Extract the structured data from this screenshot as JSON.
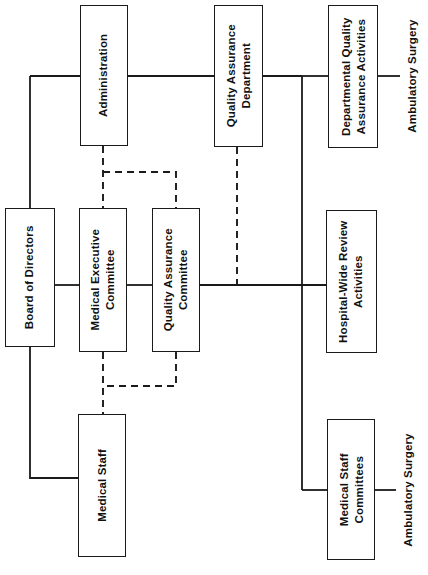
{
  "diagram": {
    "type": "organizational-chart",
    "orientation": "rotated-90-ccw",
    "background_color": "#ffffff",
    "line_color": "#1a1a1a",
    "text_color": "#111111",
    "nodes": [
      {
        "id": "administration",
        "label": "Administration",
        "x": 80,
        "y": 5,
        "w": 48,
        "h": 141
      },
      {
        "id": "quality-assurance-department",
        "label": "Quality Assurance\nDepartment",
        "x": 214,
        "y": 5,
        "w": 49,
        "h": 142
      },
      {
        "id": "departmental-quality-assurance-activities",
        "label": "Departmental Quality\nAssurance Activities",
        "x": 328,
        "y": 5,
        "w": 50,
        "h": 143
      },
      {
        "id": "board-of-directors",
        "label": "Board of Directors",
        "x": 5,
        "y": 208,
        "w": 50,
        "h": 139
      },
      {
        "id": "medical-executive-committee",
        "label": "Medical Executive\nCommittee",
        "x": 79,
        "y": 208,
        "w": 48,
        "h": 144
      },
      {
        "id": "quality-assurance-committee",
        "label": "Quality Assurance\nCommittee",
        "x": 152,
        "y": 208,
        "w": 48,
        "h": 144
      },
      {
        "id": "hospital-wide-review-activities",
        "label": "Hospital-Wide Review\nActivities",
        "x": 326,
        "y": 210,
        "w": 51,
        "h": 143
      },
      {
        "id": "medical-staff",
        "label": "Medical Staff",
        "x": 78,
        "y": 414,
        "w": 48,
        "h": 143
      },
      {
        "id": "medical-staff-committees",
        "label": "Medical Staff\nCommittees",
        "x": 327,
        "y": 419,
        "w": 48,
        "h": 141
      }
    ],
    "free_labels": [
      {
        "id": "ambulatory-surgery-top",
        "label": "Ambulatory Surgery",
        "cx": 412,
        "cy": 76
      },
      {
        "id": "ambulatory-surgery-bottom",
        "label": "Ambulatory Surgery",
        "cx": 408,
        "cy": 490
      }
    ],
    "connectors": [
      {
        "id": "admin-to-board-bus",
        "style": "solid",
        "path": "M 30 76 L 80 76"
      },
      {
        "id": "board-drop-from-bus",
        "style": "solid",
        "path": "M 30 76 L 30 208"
      },
      {
        "id": "admin-to-qa-dept",
        "style": "solid",
        "path": "M 128 76 L 214 76"
      },
      {
        "id": "qa-dept-to-right-bus",
        "style": "solid",
        "path": "M 263 76 L 302 76"
      },
      {
        "id": "right-bus-to-dept-qa",
        "style": "solid",
        "path": "M 302 76 L 328 76"
      },
      {
        "id": "right-vertical-bus",
        "style": "solid",
        "path": "M 302 76 L 302 490"
      },
      {
        "id": "dept-qa-to-ambulatory-top",
        "style": "solid",
        "path": "M 378 76 L 400 76"
      },
      {
        "id": "board-to-mec",
        "style": "solid",
        "path": "M 55 285 L 79 285"
      },
      {
        "id": "mec-to-qa-committee",
        "style": "solid",
        "path": "M 127 285 L 152 285"
      },
      {
        "id": "qa-committee-to-hwra",
        "style": "solid",
        "path": "M 200 285 L 326 285"
      },
      {
        "id": "right-bus-to-msc",
        "style": "solid",
        "path": "M 302 490 L 327 490"
      },
      {
        "id": "msc-to-ambulatory-bottom",
        "style": "solid",
        "path": "M 375 490 L 396 490"
      },
      {
        "id": "board-down-to-medstaff",
        "style": "solid",
        "path": "M 30 347 L 30 478 L 78 478"
      },
      {
        "id": "admin-dashed-to-mec",
        "style": "dashed",
        "path": "M 103 146 L 103 208"
      },
      {
        "id": "admin-dashed-branch-qac",
        "style": "dashed",
        "path": "M 103 172 L 176 172 L 176 208"
      },
      {
        "id": "qa-dept-dashed-to-bus",
        "style": "dashed",
        "path": "M 237 147 L 237 285"
      },
      {
        "id": "mec-dashed-to-medstaff",
        "style": "dashed",
        "path": "M 103 352 L 103 414"
      },
      {
        "id": "qac-dashed-branch",
        "style": "dashed",
        "path": "M 176 352 L 176 386 L 103 386"
      }
    ]
  }
}
